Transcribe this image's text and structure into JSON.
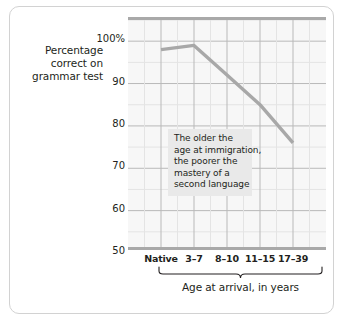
{
  "chart_data": {
    "type": "line",
    "title": "",
    "subtitle": "",
    "xlabel": "Age at arrival, in years",
    "ylabel": "Percentage correct on grammar test",
    "categories": [
      "Native",
      "3–7",
      "8–10",
      "11–15",
      "17–39"
    ],
    "values": [
      98,
      99,
      92,
      85,
      76
    ],
    "series": [
      {
        "name": "Percentage correct on grammar test",
        "values": [
          98,
          99,
          92,
          85,
          76
        ]
      }
    ],
    "ylim": [
      50,
      105
    ],
    "yticks": [
      50,
      60,
      70,
      80,
      90,
      100
    ],
    "ytick_labels": [
      "50",
      "60",
      "70",
      "80",
      "90",
      "100%"
    ],
    "grid": true,
    "minor_grid": true,
    "legend": false,
    "legend_position": "none",
    "line_color": "#a8a8a8",
    "plot_background": "#f7f7f7",
    "annotations": [
      {
        "lines": [
          "The older the",
          "age at immigration,",
          "the poorer the",
          "mastery of a",
          "second language"
        ],
        "background": "#e9e9e9"
      }
    ]
  },
  "y_axis_title": {
    "line1": "Percentage",
    "line2": "correct on",
    "line3": "grammar test"
  },
  "y_ticks": [
    {
      "label": "100%",
      "value": 100
    },
    {
      "label": "90",
      "value": 90
    },
    {
      "label": "80",
      "value": 80
    },
    {
      "label": "70",
      "value": 70
    },
    {
      "label": "60",
      "value": 60
    },
    {
      "label": "50",
      "value": 50
    }
  ],
  "x_ticks": [
    {
      "label": "Native"
    },
    {
      "label": "3–7"
    },
    {
      "label": "8–10"
    },
    {
      "label": "11–15"
    },
    {
      "label": "17–39"
    }
  ],
  "annotation": {
    "line1": "The older the",
    "line2": "age at immigration,",
    "line3": "the poorer the",
    "line4": "mastery of a",
    "line5": "second language"
  },
  "x_axis_caption": "Age at arrival, in years",
  "colors": {
    "line": "#a8a8a8",
    "plot_bg": "#f7f7f7",
    "major_grid": "#b9b9b9",
    "minor_grid": "#e4e4e4",
    "axis_band": "#a9a9a9",
    "annotation_bg": "#e9e9e9",
    "frame_border": "#d2d2d2",
    "text": "#231f20"
  }
}
